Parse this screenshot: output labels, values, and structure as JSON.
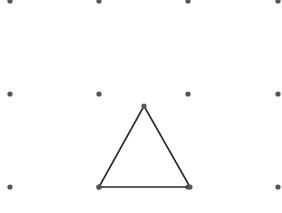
{
  "figure": {
    "type": "dot-grid-triangle",
    "grid": {
      "columns_x": [
        10,
        99,
        188,
        278
      ],
      "rows_y": [
        1,
        94,
        187
      ],
      "dot_color": "#555555",
      "dot_radius": 2.6
    },
    "triangle": {
      "vertices": [
        [
          144,
          106
        ],
        [
          99,
          187
        ],
        [
          190,
          187
        ]
      ],
      "stroke_color": "#2a2a2a",
      "stroke_width": 1.6
    },
    "caption": ""
  }
}
